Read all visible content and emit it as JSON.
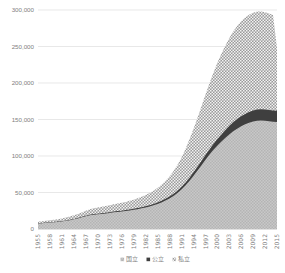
{
  "chart_data": {
    "type": "area",
    "stacked": true,
    "title": "",
    "subtitle": "",
    "xlabel": "",
    "ylabel": "",
    "ylim": [
      0,
      300000
    ],
    "yticks": [
      "0",
      "50,000",
      "100,000",
      "150,000",
      "200,000",
      "250,000",
      "300,000"
    ],
    "ytick_values": [
      0,
      50000,
      100000,
      150000,
      200000,
      250000,
      300000
    ],
    "grid": true,
    "legend_position": "bottom",
    "x": [
      1955,
      1956,
      1957,
      1958,
      1959,
      1960,
      1961,
      1962,
      1963,
      1964,
      1965,
      1966,
      1967,
      1968,
      1969,
      1970,
      1971,
      1972,
      1973,
      1974,
      1975,
      1976,
      1977,
      1978,
      1979,
      1980,
      1981,
      1982,
      1983,
      1984,
      1985,
      1986,
      1987,
      1988,
      1989,
      1990,
      1991,
      1992,
      1993,
      1994,
      1995,
      1996,
      1997,
      1998,
      1999,
      2000,
      2001,
      2002,
      2003,
      2004,
      2005,
      2006,
      2007,
      2008,
      2009,
      2010,
      2011,
      2012,
      2013,
      2014,
      2015
    ],
    "xtick_labels": [
      "1955",
      "1958",
      "1961",
      "1964",
      "1967",
      "1970",
      "1973",
      "1976",
      "1979",
      "1982",
      "1985",
      "1988",
      "1991",
      "1994",
      "1997",
      "2000",
      "2003",
      "2006",
      "2009",
      "2012",
      "2015"
    ],
    "xtick_values": [
      1955,
      1958,
      1961,
      1964,
      1967,
      1970,
      1973,
      1976,
      1979,
      1982,
      1985,
      1988,
      1991,
      1994,
      1997,
      2000,
      2003,
      2006,
      2009,
      2012,
      2015
    ],
    "series": [
      {
        "name": "国立",
        "pattern": "checker-light",
        "color": "#bfbfbf",
        "values": [
          7500,
          8000,
          8400,
          8800,
          9200,
          9700,
          10300,
          11200,
          12100,
          13200,
          14500,
          16000,
          17500,
          18800,
          19600,
          20100,
          20600,
          21200,
          22000,
          22800,
          23400,
          23900,
          24600,
          25400,
          26300,
          27200,
          28300,
          29500,
          30900,
          32500,
          34300,
          36400,
          38900,
          41800,
          45200,
          49300,
          54000,
          59600,
          65900,
          72700,
          79800,
          87100,
          94500,
          101600,
          108200,
          114000,
          119500,
          124600,
          129500,
          133800,
          137500,
          140700,
          143400,
          145600,
          147200,
          148200,
          148500,
          148200,
          147600,
          147000,
          146500
        ]
      },
      {
        "name": "公立",
        "pattern": "solid-dark",
        "color": "#404040",
        "values": [
          300,
          320,
          340,
          360,
          390,
          420,
          450,
          490,
          540,
          590,
          650,
          720,
          790,
          850,
          900,
          940,
          980,
          1020,
          1070,
          1120,
          1170,
          1220,
          1280,
          1340,
          1410,
          1490,
          1580,
          1680,
          1790,
          1910,
          2050,
          2210,
          2390,
          2590,
          2820,
          3080,
          3380,
          3720,
          4110,
          4560,
          5080,
          5680,
          6360,
          7110,
          7930,
          8800,
          9700,
          10600,
          11500,
          12350,
          13100,
          13750,
          14300,
          14750,
          15100,
          15350,
          15500,
          15550,
          15550,
          15500,
          15400
        ]
      },
      {
        "name": "私立",
        "pattern": "checker-dark",
        "color": "#808080",
        "values": [
          2200,
          2400,
          2600,
          2800,
          3000,
          3300,
          3600,
          4000,
          4400,
          4900,
          5400,
          6000,
          6700,
          7400,
          8000,
          8500,
          8900,
          9200,
          9500,
          9900,
          10300,
          10700,
          11200,
          11800,
          12500,
          13300,
          14200,
          15300,
          16600,
          18100,
          19900,
          22000,
          24500,
          27500,
          31000,
          35200,
          40200,
          46000,
          52500,
          59500,
          67000,
          74800,
          82700,
          90400,
          97700,
          104500,
          110500,
          115800,
          120400,
          124300,
          127500,
          130000,
          131900,
          133200,
          134000,
          134300,
          134000,
          133200,
          132000,
          130500,
          86100
        ]
      }
    ],
    "series_totals_note": {
      "1955": 10000,
      "1970": 29540,
      "1985": 56250,
      "1995": 151880,
      "2000": 227300,
      "2010": 297850,
      "2015": 248000
    }
  },
  "legend": {
    "items": [
      {
        "label": "国立",
        "marker": "checker-light-marker"
      },
      {
        "label": "公立",
        "marker": "solid-dark-marker"
      },
      {
        "label": "私立",
        "marker": "checker-dark-marker"
      }
    ]
  }
}
